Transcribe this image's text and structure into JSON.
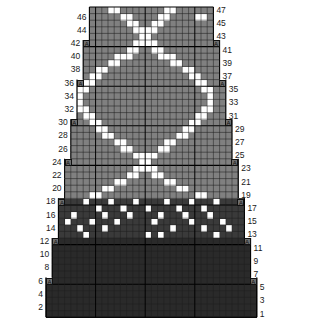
{
  "chart": {
    "type": "grid-chart",
    "kind": "knitting-colorwork-chart",
    "rows_total": 47,
    "cols_total": 34,
    "cell_width": 6.2,
    "cell_height": 6.6,
    "origin_x": 46,
    "origin_y": 7,
    "colors": {
      "background_light": "#808080",
      "background_mid": "#3a3a3a",
      "background_dark": "#2a2a2a",
      "pattern": "#ffffff",
      "gridline": "#1f1f1f",
      "heavy_gridline": "#000000",
      "label": "#1a1a1a",
      "page": "#ffffff"
    },
    "row_numbers_left": [
      46,
      44,
      42,
      40,
      38,
      36,
      34,
      32,
      30,
      28,
      26,
      24,
      22,
      20,
      18,
      16,
      14,
      12,
      10,
      8,
      6,
      4,
      2
    ],
    "row_numbers_right": [
      47,
      45,
      43,
      41,
      39,
      37,
      35,
      33,
      31,
      29,
      27,
      25,
      23,
      21,
      19,
      17,
      15,
      13,
      11,
      9,
      7,
      5,
      3,
      1
    ],
    "marker_glyph": "A",
    "marker_rows": [
      42,
      36,
      30,
      24,
      18,
      12,
      6
    ],
    "shade_bands": [
      {
        "name": "light-upper",
        "from_row": 19,
        "to_row": 47,
        "color": "#808080"
      },
      {
        "name": "mid-band",
        "from_row": 13,
        "to_row": 18,
        "color": "#3a3a3a"
      },
      {
        "name": "dark-lower",
        "from_row": 1,
        "to_row": 12,
        "color": "#2a2a2a"
      }
    ],
    "row_extents": [
      {
        "row": 1,
        "start": 1,
        "end": 34
      },
      {
        "row": 2,
        "start": 1,
        "end": 34
      },
      {
        "row": 3,
        "start": 1,
        "end": 34
      },
      {
        "row": 4,
        "start": 1,
        "end": 34
      },
      {
        "row": 5,
        "start": 1,
        "end": 34
      },
      {
        "row": 6,
        "start": 1,
        "end": 34
      },
      {
        "row": 7,
        "start": 2,
        "end": 33
      },
      {
        "row": 8,
        "start": 2,
        "end": 33
      },
      {
        "row": 9,
        "start": 2,
        "end": 33
      },
      {
        "row": 10,
        "start": 2,
        "end": 33
      },
      {
        "row": 11,
        "start": 2,
        "end": 33
      },
      {
        "row": 12,
        "start": 2,
        "end": 33
      },
      {
        "row": 13,
        "start": 3,
        "end": 32
      },
      {
        "row": 14,
        "start": 3,
        "end": 32
      },
      {
        "row": 15,
        "start": 3,
        "end": 32
      },
      {
        "row": 16,
        "start": 3,
        "end": 32
      },
      {
        "row": 17,
        "start": 3,
        "end": 32
      },
      {
        "row": 18,
        "start": 3,
        "end": 32
      },
      {
        "row": 19,
        "start": 4,
        "end": 31
      },
      {
        "row": 20,
        "start": 4,
        "end": 31
      },
      {
        "row": 21,
        "start": 4,
        "end": 31
      },
      {
        "row": 22,
        "start": 4,
        "end": 31
      },
      {
        "row": 23,
        "start": 4,
        "end": 31
      },
      {
        "row": 24,
        "start": 4,
        "end": 31
      },
      {
        "row": 25,
        "start": 5,
        "end": 30
      },
      {
        "row": 26,
        "start": 5,
        "end": 30
      },
      {
        "row": 27,
        "start": 5,
        "end": 30
      },
      {
        "row": 28,
        "start": 5,
        "end": 30
      },
      {
        "row": 29,
        "start": 5,
        "end": 30
      },
      {
        "row": 30,
        "start": 5,
        "end": 30
      },
      {
        "row": 31,
        "start": 6,
        "end": 29
      },
      {
        "row": 32,
        "start": 6,
        "end": 29
      },
      {
        "row": 33,
        "start": 6,
        "end": 29
      },
      {
        "row": 34,
        "start": 6,
        "end": 29
      },
      {
        "row": 35,
        "start": 6,
        "end": 29
      },
      {
        "row": 36,
        "start": 6,
        "end": 29
      },
      {
        "row": 37,
        "start": 7,
        "end": 28
      },
      {
        "row": 38,
        "start": 7,
        "end": 28
      },
      {
        "row": 39,
        "start": 7,
        "end": 28
      },
      {
        "row": 40,
        "start": 7,
        "end": 28
      },
      {
        "row": 41,
        "start": 7,
        "end": 28
      },
      {
        "row": 42,
        "start": 7,
        "end": 28
      },
      {
        "row": 43,
        "start": 8,
        "end": 27
      },
      {
        "row": 44,
        "start": 8,
        "end": 27
      },
      {
        "row": 45,
        "start": 8,
        "end": 27
      },
      {
        "row": 46,
        "start": 8,
        "end": 27
      },
      {
        "row": 47,
        "start": 8,
        "end": 27
      }
    ],
    "heavy_columns": [
      9,
      17,
      25
    ],
    "heavy_rows": [
      6,
      12,
      18,
      24,
      30,
      36,
      42
    ],
    "pattern_cells": {
      "47": [
        11,
        12,
        20,
        21
      ],
      "46": [
        13,
        14,
        19,
        20,
        25,
        26
      ],
      "45": [
        14,
        15,
        18,
        19
      ],
      "44": [
        15,
        16,
        17,
        18
      ],
      "43": [
        16,
        17
      ],
      "42": [
        15,
        16,
        17,
        18
      ],
      "41": [
        14,
        15,
        18,
        19
      ],
      "40": [
        12,
        13,
        14,
        19,
        20,
        21
      ],
      "39": [
        11,
        12,
        21,
        22
      ],
      "38": [
        9,
        10,
        23,
        24
      ],
      "37": [
        8,
        9,
        24,
        25
      ],
      "36": [
        7,
        8,
        25,
        26
      ],
      "35": [
        6,
        7,
        26,
        27
      ],
      "34": [
        6,
        27
      ],
      "33": [
        6,
        27
      ],
      "32": [
        6,
        7,
        26,
        27
      ],
      "31": [
        7,
        8,
        25,
        26
      ],
      "30": [
        8,
        9,
        24,
        25
      ],
      "29": [
        9,
        10,
        23,
        24
      ],
      "28": [
        10,
        11,
        22,
        23
      ],
      "27": [
        12,
        13,
        20,
        21
      ],
      "26": [
        13,
        14,
        19,
        20
      ],
      "25": [
        15,
        16,
        17,
        18
      ],
      "24": [
        16,
        17
      ],
      "23": [
        15,
        16,
        17,
        18
      ],
      "22": [
        14,
        15,
        18,
        19
      ],
      "21": [
        12,
        13,
        20,
        21
      ],
      "20": [
        10,
        11,
        22,
        23
      ],
      "19": [
        8,
        9,
        25,
        26
      ],
      "18": [
        7,
        11,
        15,
        20,
        24,
        28
      ],
      "17": [
        9,
        13,
        17,
        22,
        26
      ],
      "16": [
        5,
        10,
        14,
        19,
        23,
        27
      ],
      "15": [
        4,
        8,
        12,
        18,
        24,
        29
      ],
      "14": [
        6,
        10,
        21,
        26,
        30
      ],
      "13": [
        7,
        17,
        19,
        28
      ]
    },
    "legend": {
      "light_label": "",
      "dark_label": "",
      "pattern_label": ""
    }
  }
}
